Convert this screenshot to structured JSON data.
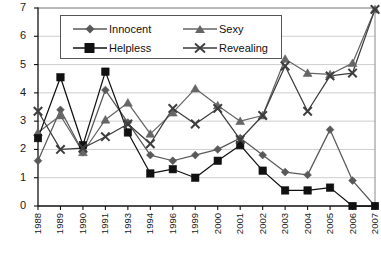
{
  "chart_data": {
    "type": "line",
    "title": "",
    "xlabel": "",
    "ylabel": "",
    "ylim": [
      0,
      7
    ],
    "yticks": [
      0,
      1,
      2,
      3,
      4,
      5,
      6,
      7
    ],
    "grid": "horizontal",
    "legend_position": "top-center",
    "categories": [
      "1988",
      "1989",
      "1990",
      "1991",
      "1993",
      "1994",
      "1996",
      "1999",
      "2000",
      "2001",
      "2002",
      "2003",
      "2004",
      "2005",
      "2006",
      "2007"
    ],
    "series": [
      {
        "name": "Innocent",
        "marker": "diamond",
        "color": "#595959",
        "values": [
          1.6,
          3.4,
          1.9,
          4.1,
          2.95,
          1.8,
          1.6,
          1.8,
          2.0,
          2.4,
          1.8,
          1.2,
          1.1,
          2.7,
          0.9,
          0.0
        ]
      },
      {
        "name": "Sexy",
        "marker": "triangle",
        "color": "#666666",
        "values": [
          2.6,
          3.2,
          1.9,
          3.05,
          3.65,
          2.55,
          3.3,
          4.15,
          3.55,
          3.0,
          3.2,
          5.2,
          4.7,
          4.65,
          5.05,
          6.95
        ]
      },
      {
        "name": "Helpless",
        "marker": "square",
        "color": "#111111",
        "values": [
          2.4,
          4.55,
          2.15,
          4.75,
          2.6,
          1.15,
          1.3,
          1.0,
          1.6,
          2.15,
          1.25,
          0.55,
          0.55,
          0.65,
          0.0,
          0.0
        ]
      },
      {
        "name": "Revealing",
        "marker": "x",
        "color": "#3d3d3d",
        "values": [
          3.35,
          2.0,
          2.05,
          2.45,
          2.9,
          2.2,
          3.45,
          2.9,
          3.45,
          2.35,
          3.2,
          4.95,
          3.35,
          4.6,
          4.7,
          6.95
        ]
      }
    ]
  },
  "legend": {
    "items": [
      {
        "label": "Innocent",
        "marker": "diamond"
      },
      {
        "label": "Sexy",
        "marker": "triangle"
      },
      {
        "label": "Helpless",
        "marker": "square"
      },
      {
        "label": "Revealing",
        "marker": "x"
      }
    ]
  },
  "axis": {
    "y_tick_labels": [
      "7",
      "6",
      "5",
      "4",
      "3",
      "2",
      "1",
      "0"
    ],
    "x_tick_labels": [
      "1988",
      "1989",
      "1990",
      "1991",
      "1993",
      "1994",
      "1996",
      "1999",
      "2000",
      "2001",
      "2002",
      "2003",
      "2004",
      "2005",
      "2006",
      "2007"
    ]
  }
}
